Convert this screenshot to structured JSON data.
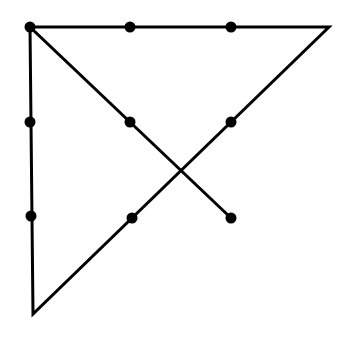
{
  "diagram": {
    "type": "nine-dot-puzzle-solution",
    "colors": {
      "background": "#ffffff",
      "line": "#000000",
      "dot": "#000000"
    },
    "line_width": 3,
    "dot_radius": 5.5,
    "dots": [
      {
        "x": 30,
        "y": 27
      },
      {
        "x": 130,
        "y": 27
      },
      {
        "x": 231,
        "y": 27
      },
      {
        "x": 30,
        "y": 122
      },
      {
        "x": 130,
        "y": 122
      },
      {
        "x": 231,
        "y": 122
      },
      {
        "x": 31,
        "y": 216
      },
      {
        "x": 132,
        "y": 218
      },
      {
        "x": 231,
        "y": 218
      }
    ],
    "path": [
      {
        "x": 231,
        "y": 218
      },
      {
        "x": 30,
        "y": 27
      },
      {
        "x": 329,
        "y": 27
      },
      {
        "x": 33,
        "y": 314
      },
      {
        "x": 30,
        "y": 27
      }
    ]
  }
}
